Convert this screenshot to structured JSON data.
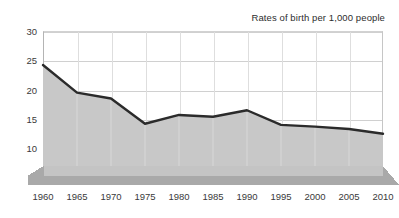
{
  "chart": {
    "title": "Rates of birth per 1,000 people",
    "type": "area"
  },
  "chart_data": {
    "type": "area",
    "title": "Rates of birth per 1,000 people",
    "xlabel": "",
    "ylabel": "",
    "categories": [
      "1960",
      "1965",
      "1970",
      "1975",
      "1980",
      "1985",
      "1990",
      "1995",
      "2000",
      "2005",
      "2010"
    ],
    "x": [
      1960,
      1965,
      1970,
      1975,
      1980,
      1985,
      1990,
      1995,
      2000,
      2005,
      2010
    ],
    "values": [
      24.2,
      19.5,
      18.5,
      14.2,
      15.7,
      15.4,
      16.5,
      14.0,
      13.7,
      13.3,
      12.5
    ],
    "series": [
      {
        "name": "Rates of birth per 1,000 people",
        "values": [
          24.2,
          19.5,
          18.5,
          14.2,
          15.7,
          15.4,
          16.5,
          14.0,
          13.7,
          13.3,
          12.5
        ]
      }
    ],
    "ylim": [
      7,
      30
    ],
    "yticks": [
      10,
      15,
      20,
      25,
      30
    ],
    "ytick_labels": [
      "10",
      "15",
      "20",
      "25",
      "30"
    ],
    "xtick_labels": [
      "1960",
      "1965",
      "1970",
      "1975",
      "1980",
      "1985",
      "1990",
      "1995",
      "2000",
      "2005",
      "2010"
    ],
    "grid": true,
    "legend": false,
    "legend_position": "none",
    "colors": {
      "area_fill": "#c8c8c8",
      "line": "#2b2b2b",
      "gridline": "#d0d0d0",
      "base_top": "#c4c4c4",
      "base_front": "#a9a9a9",
      "text": "#3a3a3a",
      "background": "#ffffff"
    }
  }
}
